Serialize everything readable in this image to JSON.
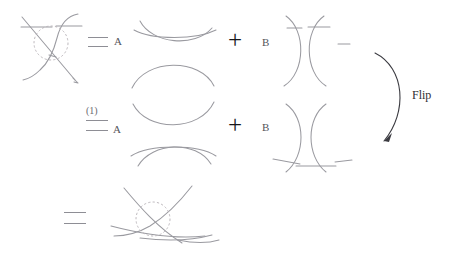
{
  "figure": {
    "background_color": "#ffffff",
    "stroke_color": "#9a9aa0",
    "label_color": "#55555a",
    "plus_color": "#16161a",
    "dashed_circle_color": "#b6b0b6"
  },
  "labels": {
    "equals_1": "=",
    "coeff_A_1": "A",
    "plus_1": "+",
    "coeff_B_1": "B",
    "index_1": "(1)",
    "equals_2": "=",
    "coeff_A_2": "A",
    "plus_2": "+",
    "coeff_B_2": "B",
    "equals_3": "=",
    "flip": "Flip"
  },
  "rows": [
    {
      "name": "row-1",
      "left_diagram": "crossing-with-dashed-circle",
      "relation": "=",
      "first_coefficient": "A",
      "first_term": "horizontal-smoothing-arcs",
      "operator": "+",
      "second_coefficient": "B",
      "second_term": "vertical-smoothing-arcs"
    },
    {
      "name": "row-2",
      "index": "(1)",
      "relation": "=",
      "first_coefficient": "A",
      "first_term": "horizontal-smoothing-arcs-mirrored",
      "operator": "+",
      "second_coefficient": "B",
      "second_term": "vertical-smoothing-arcs-mirrored"
    },
    {
      "name": "row-3",
      "relation": "=",
      "left_diagram": "crossing-with-dashed-circle-flipped"
    }
  ],
  "annotations": [
    {
      "name": "flip-arrow",
      "label": "Flip",
      "direction": "clockwise-down-left"
    }
  ]
}
